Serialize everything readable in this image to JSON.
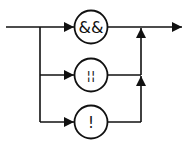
{
  "diagram": {
    "type": "syntax-railroad",
    "colors": {
      "stroke": "#111111",
      "background": "#ffffff"
    },
    "operators": [
      {
        "id": "and",
        "label": "&&",
        "cy": 27
      },
      {
        "id": "or",
        "label": "¦¦",
        "cy": 75
      },
      {
        "id": "not",
        "label": "!",
        "cy": 122
      }
    ]
  }
}
